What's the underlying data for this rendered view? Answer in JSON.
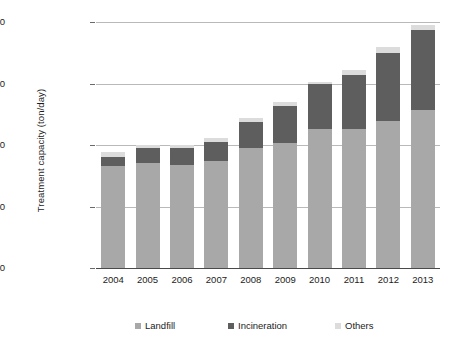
{
  "chart_data": {
    "type": "bar",
    "stacked": true,
    "title": "",
    "xlabel": "",
    "ylabel": "Treatment capacity (ton/day)",
    "categories": [
      "2004",
      "2005",
      "2006",
      "2007",
      "2008",
      "2009",
      "2010",
      "2011",
      "2012",
      "2013"
    ],
    "series": [
      {
        "name": "Landfill",
        "color": "#a8a8a8",
        "values": [
          207000,
          213000,
          209000,
          217000,
          244000,
          254000,
          283000,
          283000,
          299000,
          321000
        ]
      },
      {
        "name": "Incineration",
        "color": "#5e5e5e",
        "values": [
          18000,
          31000,
          35000,
          39000,
          53000,
          75000,
          91000,
          109000,
          138000,
          163000
        ]
      },
      {
        "name": "Others",
        "color": "#dcdcdc",
        "values": [
          11000,
          6000,
          6000,
          8000,
          8000,
          8000,
          4000,
          10000,
          12000,
          10000
        ]
      }
    ],
    "totals": [
      236000,
      250000,
      250000,
      264000,
      305000,
      337000,
      378000,
      402000,
      449000,
      494000
    ],
    "ylim": [
      0,
      500000
    ],
    "yticks": [
      0,
      125000,
      250000,
      375000,
      500000
    ],
    "ytick_labels": [
      "0",
      "125000",
      "250000",
      "375000",
      "500000"
    ],
    "grid": true,
    "legend_position": "bottom"
  },
  "legend": {
    "items": [
      {
        "label": "Landfill",
        "color": "#a8a8a8"
      },
      {
        "label": "Incineration",
        "color": "#5e5e5e"
      },
      {
        "label": "Others",
        "color": "#dcdcdc"
      }
    ]
  }
}
